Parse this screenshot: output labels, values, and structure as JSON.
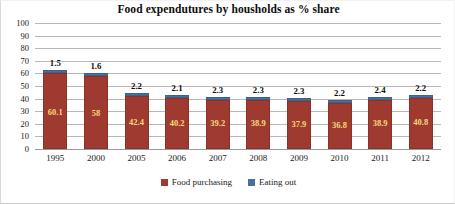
{
  "chart_data": {
    "type": "bar",
    "subtype": "stacked-column",
    "title": "Food expendutures by housholds as % share",
    "xlabel": "",
    "ylabel": "",
    "ylim": [
      0,
      100
    ],
    "ytick_step": 10,
    "yticks": [
      "100",
      "90",
      "80",
      "70",
      "60",
      "50",
      "40",
      "30",
      "20",
      "10",
      "0"
    ],
    "grid": true,
    "legend_position": "bottom",
    "categories": [
      "1995",
      "2000",
      "2005",
      "2006",
      "2007",
      "2008",
      "2009",
      "2010",
      "2011",
      "2012"
    ],
    "series": [
      {
        "name": "Food purchasing",
        "color": "#9e3a2f",
        "values": [
          60.1,
          58,
          42.4,
          40.2,
          39.2,
          38.9,
          37.9,
          36.8,
          38.9,
          40.8
        ],
        "labels": [
          "60.1",
          "58",
          "42.4",
          "40.2",
          "39.2",
          "38.9",
          "37.9",
          "36.8",
          "38.9",
          "40.8"
        ],
        "label_color": "#f7d97a"
      },
      {
        "name": "Eating out",
        "color": "#4a6f9e",
        "values": [
          1.5,
          1.6,
          2.2,
          2.1,
          2.3,
          2.3,
          2.3,
          2.2,
          2.4,
          2.2
        ],
        "labels": [
          "1.5",
          "1.6",
          "2.2",
          "2.1",
          "2.3",
          "2.3",
          "2.3",
          "2.2",
          "2.4",
          "2.2"
        ],
        "label_color": "#0d0d0d"
      }
    ],
    "totals": [
      61.6,
      59.6,
      44.6,
      42.3,
      41.5,
      41.2,
      40.2,
      39.0,
      41.3,
      43.0
    ]
  },
  "legend": {
    "items": [
      {
        "label": "Food purchasing",
        "color": "#9e3a2f"
      },
      {
        "label": "Eating out",
        "color": "#4a6f9e"
      }
    ]
  }
}
